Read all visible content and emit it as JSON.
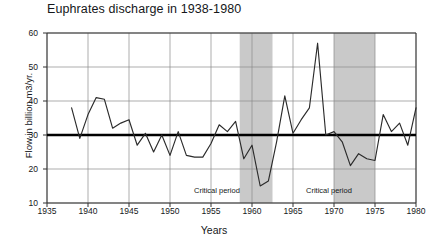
{
  "chart_data": {
    "type": "line",
    "title": "Euphrates discharge in 1938-1980",
    "xlabel": "Years",
    "ylabel": "Flow in billion m3/yr.",
    "xlim": [
      1935,
      1980
    ],
    "ylim": [
      10,
      60
    ],
    "xticks": [
      1935,
      1940,
      1945,
      1950,
      1955,
      1960,
      1965,
      1970,
      1975,
      1980
    ],
    "yticks": [
      10,
      20,
      30,
      40,
      50,
      60
    ],
    "grid": true,
    "legend": "none",
    "series": [
      {
        "name": "Euphrates discharge",
        "x": [
          1938,
          1939,
          1940,
          1941,
          1942,
          1943,
          1944,
          1945,
          1946,
          1947,
          1948,
          1949,
          1950,
          1951,
          1952,
          1953,
          1954,
          1955,
          1956,
          1957,
          1958,
          1959,
          1960,
          1961,
          1962,
          1963,
          1964,
          1965,
          1966,
          1967,
          1968,
          1969,
          1970,
          1971,
          1972,
          1973,
          1974,
          1975,
          1976,
          1977,
          1978,
          1979,
          1980
        ],
        "values": [
          38.0,
          29.0,
          36.0,
          41.0,
          40.5,
          32.0,
          33.5,
          34.5,
          27.0,
          30.5,
          25.0,
          30.0,
          24.0,
          31.0,
          24.0,
          23.5,
          23.5,
          27.5,
          33.0,
          31.0,
          34.0,
          23.0,
          27.0,
          15.0,
          16.5,
          28.0,
          41.5,
          30.5,
          34.5,
          38.0,
          57.0,
          30.0,
          31.0,
          28.0,
          21.0,
          24.5,
          23.0,
          22.5,
          36.0,
          31.0,
          33.5,
          27.0,
          38.0
        ]
      }
    ],
    "reference_line": {
      "value": 30,
      "style": "bold-horizontal"
    },
    "shaded_bands": [
      {
        "label": "Critical period",
        "start": 1958.5,
        "end": 1962.5
      },
      {
        "label": "Critical period",
        "start": 1970.0,
        "end": 1975.0
      }
    ],
    "annotations": [
      {
        "text": "Critical period",
        "x": 1955.4,
        "y": 13.2
      },
      {
        "text": "Critical period",
        "x": 1968.6,
        "y": 13.2
      }
    ],
    "colors": {
      "line": "#2b2b2b",
      "reference_line": "#000000",
      "band": "#c9c9c9",
      "grid": "#8a8a8a",
      "axis": "#333333",
      "background": "#ffffff"
    }
  }
}
